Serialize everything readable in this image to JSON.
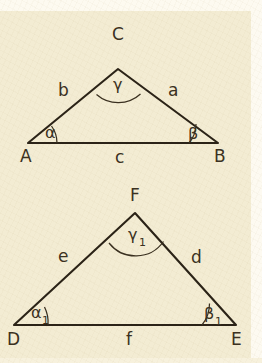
{
  "figure": {
    "background_color": "#f3ecd3",
    "line_color": "#2b2317",
    "text_color": "#3b3121"
  },
  "triangles": [
    {
      "id": "upper",
      "vertices": [
        {
          "name": "A",
          "label": "A",
          "x": 28,
          "y": 143,
          "label_x": 20,
          "label_y": 162
        },
        {
          "name": "B",
          "label": "B",
          "x": 218,
          "y": 143,
          "label_x": 214,
          "label_y": 162
        },
        {
          "name": "C",
          "label": "C",
          "x": 118,
          "y": 69,
          "label_x": 112,
          "label_y": 40
        }
      ],
      "sides": [
        {
          "name": "side-b",
          "label": "b",
          "x": 58,
          "y": 96
        },
        {
          "name": "side-a",
          "label": "a",
          "x": 168,
          "y": 96
        },
        {
          "name": "side-c",
          "label": "c",
          "x": 115,
          "y": 163
        }
      ],
      "angles": [
        {
          "name": "angle-alpha",
          "label": "α",
          "sub": "",
          "x": 45,
          "y": 138,
          "arc_radius": 29
        },
        {
          "name": "angle-beta",
          "label": "β",
          "sub": "",
          "x": 188,
          "y": 139,
          "arc_radius": 29
        },
        {
          "name": "angle-gamma",
          "label": "γ",
          "sub": "",
          "x": 113,
          "y": 90,
          "arc_radius": 33
        }
      ]
    },
    {
      "id": "lower",
      "vertices": [
        {
          "name": "D",
          "label": "D",
          "x": 14,
          "y": 325,
          "label_x": 7,
          "label_y": 345
        },
        {
          "name": "E",
          "label": "E",
          "x": 236,
          "y": 325,
          "label_x": 231,
          "label_y": 345
        },
        {
          "name": "F",
          "label": "F",
          "x": 135,
          "y": 213,
          "label_x": 130,
          "label_y": 201
        },
        {
          "name": "F-apex-label",
          "label": "F",
          "x": 135,
          "y": 213,
          "label_x": 130,
          "label_y": 201
        }
      ],
      "sides": [
        {
          "name": "side-e",
          "label": "e",
          "x": 58,
          "y": 262
        },
        {
          "name": "side-d",
          "label": "d",
          "x": 191,
          "y": 263
        },
        {
          "name": "side-f",
          "label": "f",
          "x": 126,
          "y": 345
        }
      ],
      "angles": [
        {
          "name": "angle-alpha-1",
          "label": "α",
          "sub": "1",
          "x": 31,
          "y": 318,
          "arc_radius": 34
        },
        {
          "name": "angle-beta-1",
          "label": "β",
          "sub": "1",
          "x": 204,
          "y": 319,
          "arc_radius": 34
        },
        {
          "name": "angle-gamma-1",
          "label": "γ",
          "sub": "1",
          "x": 128,
          "y": 240,
          "arc_radius": 34
        }
      ]
    }
  ],
  "geometry": {
    "upper_path": "M 28 143 L 218 143 L 118 69 Z",
    "lower_path": "M 14 325 L 236 325 L 135 213 Z",
    "upper_arc_alpha": "M 57 143 A 29 29 0 0 0 51.5 126.0",
    "upper_arc_beta": "M 189 143 A 29 29 0 0 0 196.0 124.0",
    "upper_arc_gamma": "M 96.5 94.5 A 33 33 0 0 0 140.5 94.0",
    "lower_arc_alpha1": "M 48 325 A 34 34 0 0 0 44.5 307.0",
    "lower_arc_beta1": "M 202 325 A 34 34 0 0 0 209.5 303.5",
    "lower_arc_gamma1": "M 109 243 A 34 34 0 0 0 163.5 241.5"
  }
}
